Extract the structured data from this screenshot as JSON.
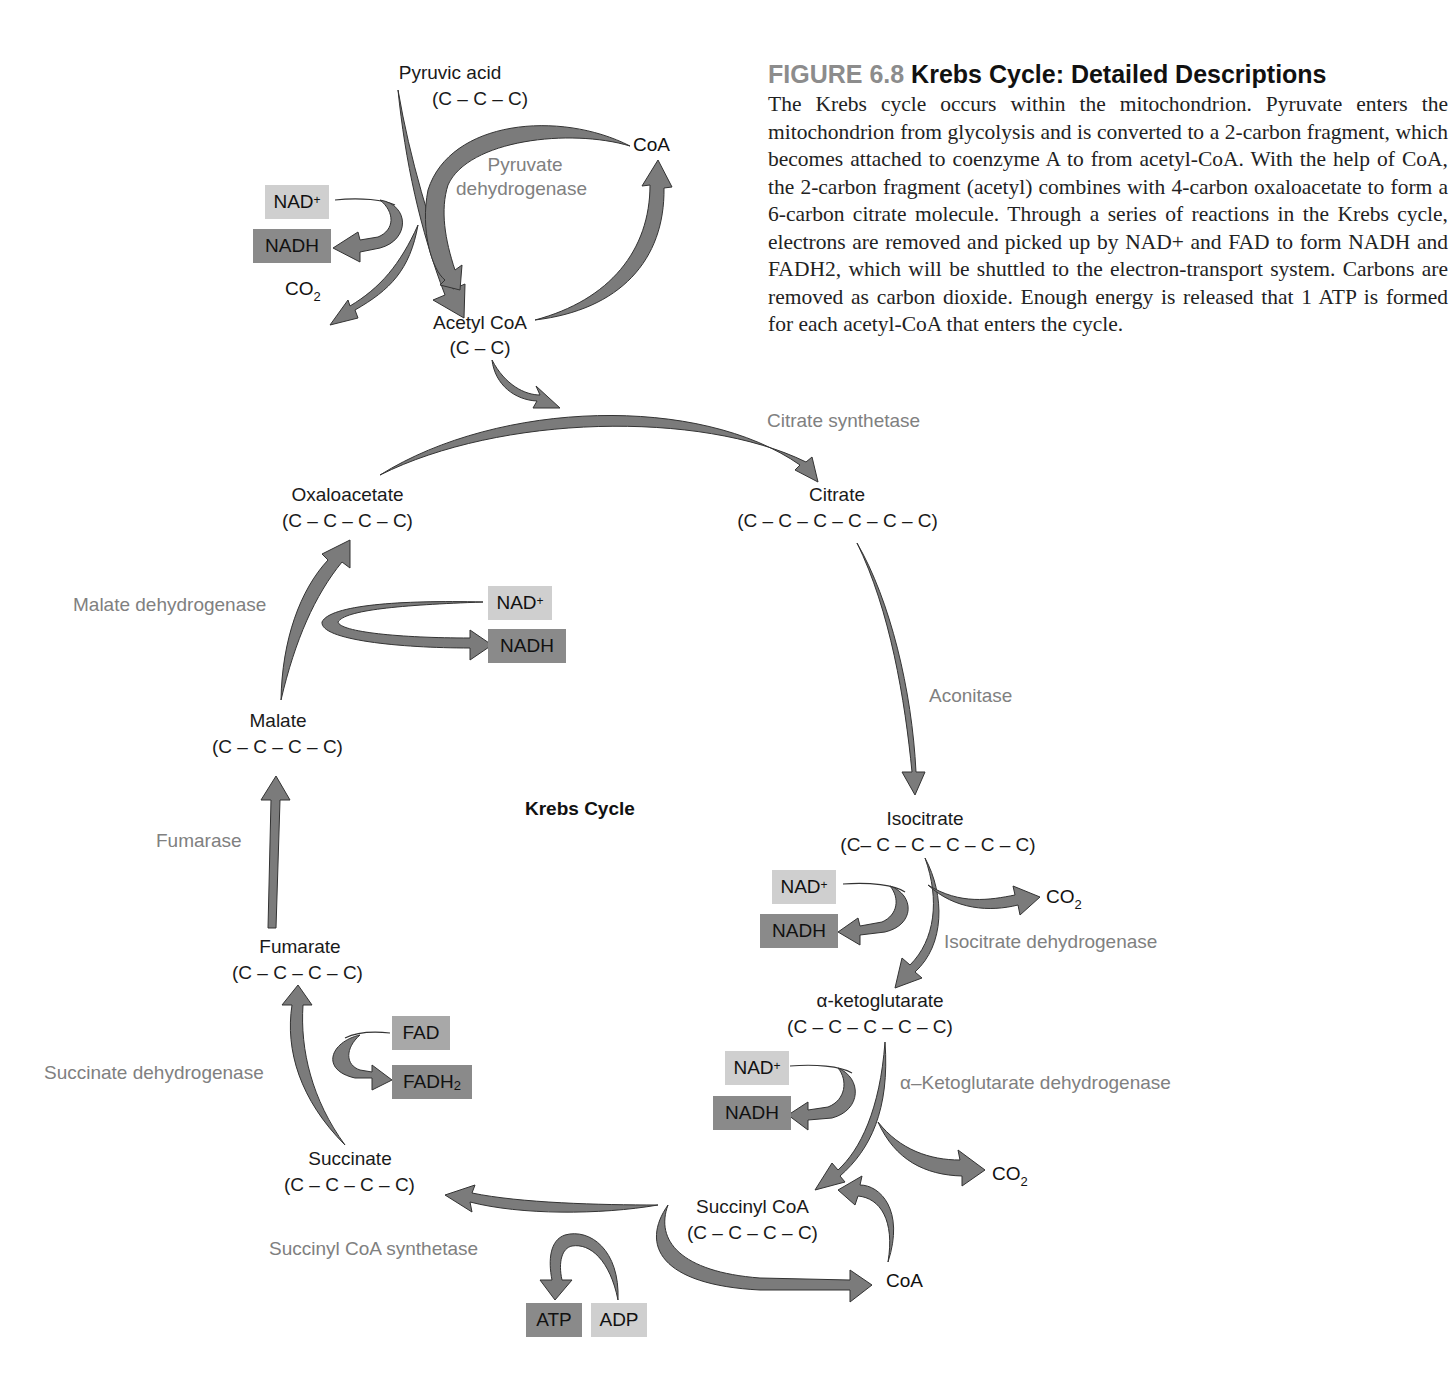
{
  "caption": {
    "figure_number": "FIGURE 6.8",
    "title": "Krebs Cycle: Detailed Descriptions",
    "body": "The Krebs cycle occurs within the mitochondrion. Pyruvate enters the mitochondrion from glycolysis and is converted to a 2-carbon fragment, which becomes attached to coenzyme A to from acetyl-CoA. With the help of CoA, the 2-carbon fragment (acetyl) combines with 4-carbon oxaloacetate to form a 6-carbon citrate molecule. Through a series of reactions in the Krebs cycle, electrons are removed and picked up by NAD+ and FAD to form NADH and FADH2, which will be shuttled to the electron-transport system. Carbons are removed as carbon dioxide. Enough energy is released that 1 ATP is formed for each acetyl-CoA that enters the cycle."
  },
  "diagram": {
    "center_title": "Krebs Cycle",
    "colors": {
      "arrow_fill": "#7b7b7b",
      "box_light": "#cfcfcf",
      "box_dark": "#8a8a8a",
      "enzyme_text": "#808080",
      "figure_number": "#8c8c8c"
    },
    "molecules": {
      "pyruvic_acid": {
        "name": "Pyruvic acid",
        "formula": "(C – C – C)"
      },
      "acetyl_coa": {
        "name": "Acetyl CoA",
        "formula": "(C – C)"
      },
      "oxaloacetate": {
        "name": "Oxaloacetate",
        "formula": "(C – C – C – C)"
      },
      "citrate": {
        "name": "Citrate",
        "formula": "(C – C – C – C – C – C)"
      },
      "isocitrate": {
        "name": "Isocitrate",
        "formula": "(C– C – C – C – C – C)"
      },
      "alpha_ketoglutarate": {
        "name": "α-ketoglutarate",
        "formula": "(C – C – C – C – C)"
      },
      "succinyl_coa": {
        "name": "Succinyl CoA",
        "formula": "(C – C – C – C)"
      },
      "succinate": {
        "name": "Succinate",
        "formula": "(C – C – C – C)"
      },
      "fumarate": {
        "name": "Fumarate",
        "formula": "(C – C – C – C)"
      },
      "malate": {
        "name": "Malate",
        "formula": "(C – C – C – C)"
      }
    },
    "enzymes": {
      "pyruvate_dh_line1": "Pyruvate",
      "pyruvate_dh_line2": "dehydrogenase",
      "citrate_synthetase": "Citrate synthetase",
      "aconitase": "Aconitase",
      "isocitrate_dh": "Isocitrate dehydrogenase",
      "akg_dh": "α–Ketoglutarate dehydrogenase",
      "succinyl_coa_synthetase": "Succinyl CoA synthetase",
      "succinate_dh": "Succinate dehydrogenase",
      "fumarase": "Fumarase",
      "malate_dh": "Malate dehydrogenase"
    },
    "cofactors": {
      "nad": "NAD",
      "nad_sup": "+",
      "nadh": "NADH",
      "fad": "FAD",
      "fadh": "FADH",
      "fadh_sub": "2",
      "atp": "ATP",
      "adp": "ADP",
      "co": "CO",
      "co_sub": "2",
      "coa": "CoA"
    }
  }
}
